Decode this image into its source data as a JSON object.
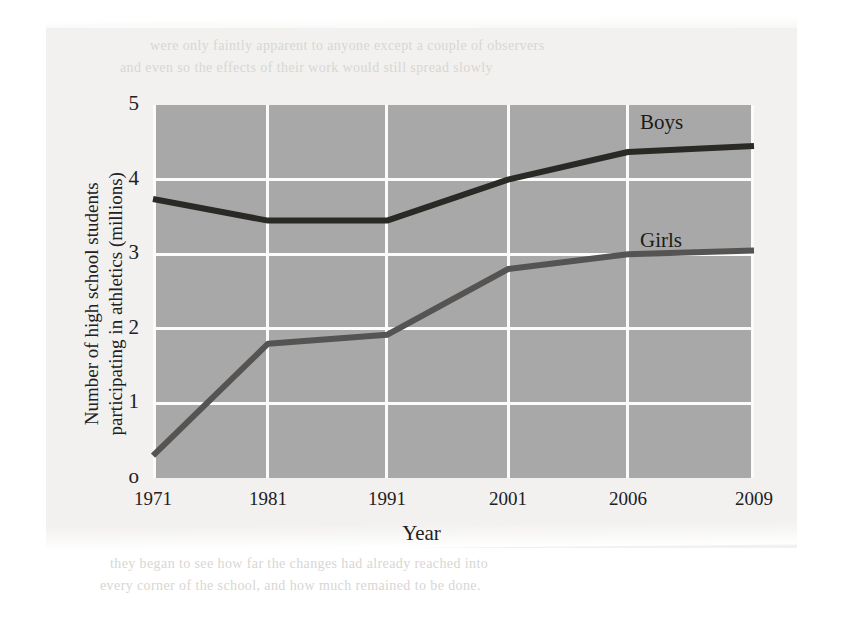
{
  "chart_data": {
    "type": "line",
    "title": "",
    "xlabel": "Year",
    "ylabel": "Number of high school students participating in athletics (millions)",
    "ylabel_line1": "Number of high school students",
    "ylabel_line2": "participating in athletics (millions)",
    "categories": [
      "1971",
      "1981",
      "1991",
      "2001",
      "2006",
      "2009"
    ],
    "x": [
      1971,
      1981,
      1991,
      2001,
      2006,
      2009
    ],
    "ylim": [
      0,
      5
    ],
    "yticks": [
      "o",
      "1",
      "2",
      "3",
      "4",
      "5"
    ],
    "ytick_values": [
      0,
      1,
      2,
      3,
      4,
      5
    ],
    "grid": true,
    "legend_position": "inline-right",
    "series": [
      {
        "name": "Boys",
        "color": "#2b2926",
        "values": [
          3.74,
          3.45,
          3.45,
          4.0,
          4.37,
          4.45
        ]
      },
      {
        "name": "Girls",
        "color": "#565452",
        "values": [
          0.3,
          1.8,
          1.92,
          2.8,
          3.0,
          3.05
        ]
      }
    ],
    "plot_background": "#a8a8a8",
    "gridline_color": "#fbfbfb"
  },
  "page": {
    "background": "#f2f1ef",
    "ghost_text_top_1": "were only faintly apparent to anyone except a couple of observers",
    "ghost_text_top_2": "and even so the effects of their work would still spread slowly",
    "ghost_text_bottom_1": "they began to see how far the changes had already reached into",
    "ghost_text_bottom_2": "every corner of the school, and how much remained to be done."
  }
}
